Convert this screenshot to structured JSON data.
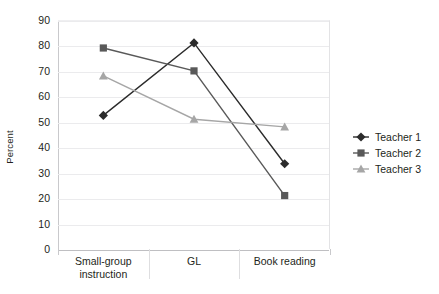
{
  "chart_data": {
    "type": "line",
    "title": "",
    "subtitle": "",
    "xlabel": "",
    "ylabel": "Percent",
    "categories": [
      "Small-group instruction",
      "GL",
      "Book reading"
    ],
    "category_lines": [
      [
        "Small-group",
        "instruction"
      ],
      [
        "GL"
      ],
      [
        "Book reading"
      ]
    ],
    "ylim": [
      0,
      90
    ],
    "ytick_step": 10,
    "yticks": [
      0,
      10,
      20,
      30,
      40,
      50,
      60,
      70,
      80,
      90
    ],
    "ytick_labels": [
      "0",
      "10",
      "20",
      "30",
      "40",
      "50",
      "60",
      "70",
      "80",
      "90"
    ],
    "grid": true,
    "grid_axis": "y",
    "legend_position": "right",
    "series": [
      {
        "name": "Teacher 1",
        "marker": "diamond",
        "color": "#2b2b2b",
        "values": [
          52.5,
          81,
          33.5
        ]
      },
      {
        "name": "Teacher 2",
        "marker": "square",
        "color": "#595959",
        "values": [
          79,
          70,
          21
        ]
      },
      {
        "name": "Teacher 3",
        "marker": "triangle",
        "color": "#a6a6a6",
        "values": [
          68,
          51,
          48
        ]
      }
    ]
  },
  "legend": {
    "items": [
      {
        "label": "Teacher 1"
      },
      {
        "label": "Teacher 2"
      },
      {
        "label": "Teacher 3"
      }
    ]
  },
  "colors": {
    "gridline": "#ebebed",
    "axis": "#c9c9cc",
    "text": "#231f20",
    "background": "#ffffff"
  }
}
